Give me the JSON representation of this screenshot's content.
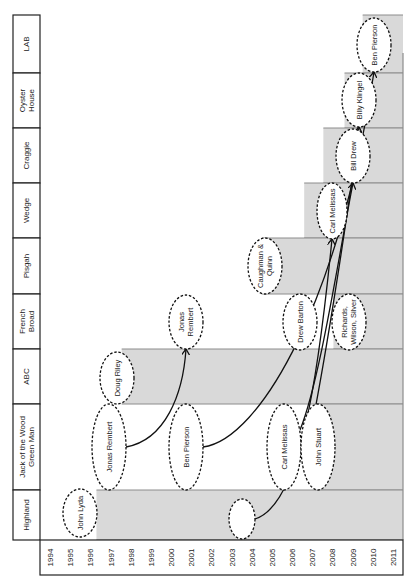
{
  "colors": {
    "bar": "#d9d9d9",
    "bar_edge": "#8c8c8c",
    "grid": "#222222",
    "bubble_fill": "#ffffff",
    "bubble_stroke": "#111111",
    "arrow": "#111111"
  },
  "years": [
    "1994",
    "1995",
    "1996",
    "1997",
    "1998",
    "1999",
    "2000",
    "2001",
    "2002",
    "2003",
    "2004",
    "2005",
    "2006",
    "2007",
    "2008",
    "2009",
    "2010",
    "2011"
  ],
  "restaurants": [
    {
      "name": "LAB",
      "lines": [
        "LAB"
      ],
      "bar_start_year": 2010.0
    },
    {
      "name": "Oyster House",
      "lines": [
        "Oyster",
        "House"
      ],
      "bar_start_year": 2009.1
    },
    {
      "name": "Craggie",
      "lines": [
        "Craggie"
      ],
      "bar_start_year": 2008.05
    },
    {
      "name": "Wedge",
      "lines": [
        "Wedge"
      ],
      "bar_start_year": 2007.1
    },
    {
      "name": "Pisgah",
      "lines": [
        "Pisgah"
      ],
      "bar_start_year": 2005.0
    },
    {
      "name": "French Broad",
      "lines": [
        "French",
        "Broad"
      ],
      "bar_start_year": 2008.55
    },
    {
      "name": "ABC",
      "lines": [
        "ABC"
      ],
      "bar_start_year": 1998.05
    },
    {
      "name": "Jack of the Wood Green Man",
      "lines": [
        "Jack of the Wood",
        "Green Man"
      ],
      "bar_start_year": 2007.7
    },
    {
      "name": "Highland",
      "lines": [
        "Highland"
      ],
      "bar_start_year": 1996.8
    }
  ],
  "chefs": [
    {
      "id": "john-lyda",
      "lines": [
        "John Lyda"
      ],
      "cx": 80,
      "cy": 513,
      "rx": 17,
      "ry": 24
    },
    {
      "id": "jonas-rembert-jack",
      "lines": [
        "Jonas Rembert"
      ],
      "cx": 109,
      "cy": 447,
      "rx": 17,
      "ry": 43
    },
    {
      "id": "doug-riley",
      "lines": [
        "Doug Riley"
      ],
      "cx": 117,
      "cy": 378,
      "rx": 17,
      "ry": 26
    },
    {
      "id": "jonas-rembert-fb",
      "lines": [
        "Jonas",
        "Rembert"
      ],
      "cx": 186,
      "cy": 322,
      "rx": 17,
      "ry": 27
    },
    {
      "id": "ben-pierson-jack",
      "lines": [
        "Ben Pierson"
      ],
      "cx": 186,
      "cy": 447,
      "rx": 17,
      "ry": 43
    },
    {
      "id": "unnamed",
      "lines": [
        ""
      ],
      "cx": 242,
      "cy": 519,
      "rx": 13,
      "ry": 20
    },
    {
      "id": "carl-melissas-jack",
      "lines": [
        "Carl Melissas"
      ],
      "cx": 284,
      "cy": 447,
      "rx": 17,
      "ry": 43
    },
    {
      "id": "john-stuart",
      "lines": [
        "John Stuart"
      ],
      "cx": 318,
      "cy": 447,
      "rx": 17,
      "ry": 43
    },
    {
      "id": "drew-barton",
      "lines": [
        "Drew Barton"
      ],
      "cx": 300,
      "cy": 322,
      "rx": 17,
      "ry": 28
    },
    {
      "id": "richards-wilson-silver",
      "lines": [
        "Richards,",
        "Wilson, Silver"
      ],
      "cx": 349,
      "cy": 322,
      "rx": 17,
      "ry": 28
    },
    {
      "id": "caughman-quinn",
      "lines": [
        "Caughman &",
        "Quinn"
      ],
      "cx": 265,
      "cy": 266,
      "rx": 17,
      "ry": 28
    },
    {
      "id": "carl-melissas-wedge",
      "lines": [
        "Carl Melissas"
      ],
      "cx": 332,
      "cy": 211,
      "rx": 15,
      "ry": 28
    },
    {
      "id": "bill-drew",
      "lines": [
        "Bill Drew"
      ],
      "cx": 353,
      "cy": 156,
      "rx": 17,
      "ry": 27
    },
    {
      "id": "billy-klingel",
      "lines": [
        "Billy Klingel"
      ],
      "cx": 359,
      "cy": 100,
      "rx": 17,
      "ry": 27
    },
    {
      "id": "ben-pierson-lab",
      "lines": [
        "Ben Pierson"
      ],
      "cx": 374,
      "cy": 45,
      "rx": 17,
      "ry": 27
    }
  ],
  "arrows": [
    {
      "from": "jonas-rembert-jack",
      "to": "jonas-rembert-fb",
      "path": "M126,447 C165,440 183,395 186,349"
    },
    {
      "from": "ben-pierson-jack",
      "to": "ben-pierson-lab",
      "path": "M203,447 C260,440 340,300 374,72"
    },
    {
      "from": "unnamed",
      "to": "carl-melissas-wedge",
      "path": "M255,519 C300,505 318,380 332,239"
    },
    {
      "from": "carl-melissas-jack",
      "to": "bill-drew",
      "path": "M300,430 C320,380 338,260 353,183"
    },
    {
      "from": "john-stuart",
      "to": "billy-klingel",
      "path": "M315,410 C330,330 350,200 359,127"
    }
  ],
  "chart_data": {
    "type": "timeline",
    "orientation": "rotated -90deg",
    "xlabel": "Year",
    "x": [
      "1994",
      "1995",
      "1996",
      "1997",
      "1998",
      "1999",
      "2000",
      "2001",
      "2002",
      "2003",
      "2004",
      "2005",
      "2006",
      "2007",
      "2008",
      "2009",
      "2010",
      "2011"
    ],
    "rows": [
      "Highland",
      "Jack of the Wood Green Man",
      "ABC",
      "French Broad",
      "Pisgah",
      "Wedge",
      "Craggie",
      "Oyster House",
      "LAB"
    ],
    "open_since": {
      "Highland": 1997,
      "ABC": 1998,
      "Pisgah": 2005,
      "Wedge": 2007,
      "Jack of the Wood Green Man": 2008,
      "Craggie": 2008,
      "French Broad": 2009,
      "Oyster House": 2009,
      "LAB": 2010
    },
    "chefs": [
      {
        "name": "John Lyda",
        "restaurant": "Highland",
        "year": 1996
      },
      {
        "name": "Jonas Rembert",
        "restaurant": "Jack of the Wood Green Man",
        "year": 1997
      },
      {
        "name": "Doug Riley",
        "restaurant": "ABC",
        "year": 1998
      },
      {
        "name": "Jonas Rembert",
        "restaurant": "French Broad",
        "year": 2001
      },
      {
        "name": "Ben Pierson",
        "restaurant": "Jack of the Wood Green Man",
        "year": 2001
      },
      {
        "name": "(unnamed)",
        "restaurant": "Highland",
        "year": 2004
      },
      {
        "name": "Carl Melissas",
        "restaurant": "Jack of the Wood Green Man",
        "year": 2006
      },
      {
        "name": "John Stuart",
        "restaurant": "Jack of the Wood Green Man",
        "year": 2007
      },
      {
        "name": "Caughman & Quinn",
        "restaurant": "Pisgah",
        "year": 2005
      },
      {
        "name": "Drew Barton",
        "restaurant": "French Broad",
        "year": 2006
      },
      {
        "name": "Richards, Wilson, Silver",
        "restaurant": "French Broad",
        "year": 2008
      },
      {
        "name": "Carl Melissas",
        "restaurant": "Wedge",
        "year": 2007
      },
      {
        "name": "Bill Drew",
        "restaurant": "Craggie",
        "year": 2008
      },
      {
        "name": "Billy Klingel",
        "restaurant": "Oyster House",
        "year": 2009
      },
      {
        "name": "Ben Pierson",
        "restaurant": "LAB",
        "year": 2010
      }
    ],
    "moves": [
      {
        "chef": "Jonas Rembert",
        "from": "Jack of the Wood Green Man",
        "to": "French Broad"
      },
      {
        "chef": "Ben Pierson",
        "from": "Jack of the Wood Green Man",
        "to": "LAB"
      },
      {
        "chef": "Carl Melissas",
        "from": "Highland",
        "to": "Wedge"
      },
      {
        "chef": "Bill Drew",
        "from": "Jack of the Wood Green Man",
        "to": "Craggie"
      },
      {
        "chef": "Billy Klingel",
        "from": "Jack of the Wood Green Man",
        "to": "Oyster House"
      }
    ]
  }
}
